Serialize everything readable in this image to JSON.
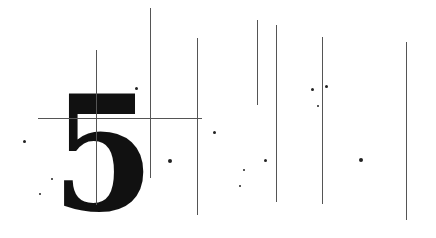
{
  "graphic": {
    "numeral": "5",
    "colors": {
      "background": "#ffffff",
      "ink": "#111111",
      "line": "#555555"
    },
    "vertical_lines": [
      {
        "x": 96,
        "y1": 50,
        "y2": 205
      },
      {
        "x": 150,
        "y1": 8,
        "y2": 178
      },
      {
        "x": 197,
        "y1": 38,
        "y2": 215
      },
      {
        "x": 257,
        "y1": 20,
        "y2": 105
      },
      {
        "x": 276,
        "y1": 25,
        "y2": 202
      },
      {
        "x": 322,
        "y1": 37,
        "y2": 204
      },
      {
        "x": 406,
        "y1": 42,
        "y2": 220
      }
    ],
    "horizontal_lines": [
      {
        "y": 118,
        "x1": 38,
        "x2": 202
      }
    ],
    "dots": [
      {
        "x": 24,
        "y": 141,
        "r": 1.5
      },
      {
        "x": 40,
        "y": 194,
        "r": 1
      },
      {
        "x": 52,
        "y": 179,
        "r": 1
      },
      {
        "x": 136,
        "y": 88,
        "r": 1.5
      },
      {
        "x": 170,
        "y": 161,
        "r": 2
      },
      {
        "x": 214,
        "y": 132,
        "r": 1.5
      },
      {
        "x": 240,
        "y": 186,
        "r": 1
      },
      {
        "x": 244,
        "y": 170,
        "r": 1
      },
      {
        "x": 265,
        "y": 160,
        "r": 1.5
      },
      {
        "x": 312,
        "y": 89,
        "r": 1.5
      },
      {
        "x": 318,
        "y": 106,
        "r": 1
      },
      {
        "x": 326,
        "y": 86,
        "r": 1.5
      },
      {
        "x": 361,
        "y": 160,
        "r": 2
      }
    ]
  }
}
